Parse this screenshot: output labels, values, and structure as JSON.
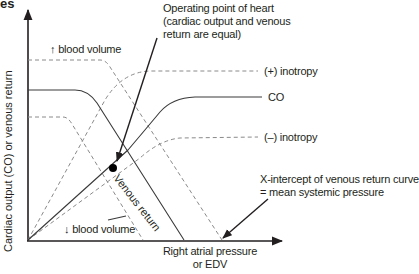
{
  "figure": {
    "title_fragment": "es",
    "y_axis_label": "Cardiac output (CO) or venous return",
    "x_axis_label_line1": "Right atrial pressure",
    "x_axis_label_line2": "or EDV",
    "annotations": {
      "operating_point_line1": "Operating point of heart",
      "operating_point_line2": "(cardiac output and venous",
      "operating_point_line3": "return are equal)",
      "x_intercept_line1": "X-intercept of venous return curve",
      "x_intercept_line2": "= mean systemic pressure"
    },
    "curve_labels": {
      "increased_blood_volume": "↑ blood volume",
      "decreased_blood_volume": "↓ blood volume",
      "positive_inotropy": "(+) inotropy",
      "cardiac_output": "CO",
      "negative_inotropy": "(–) inotropy",
      "venous_return": "Venous return"
    },
    "colors": {
      "solid_line": "#3a3a3a",
      "dashed_line": "#8a8a8a",
      "axis": "#231f20",
      "text": "#231f20"
    }
  }
}
